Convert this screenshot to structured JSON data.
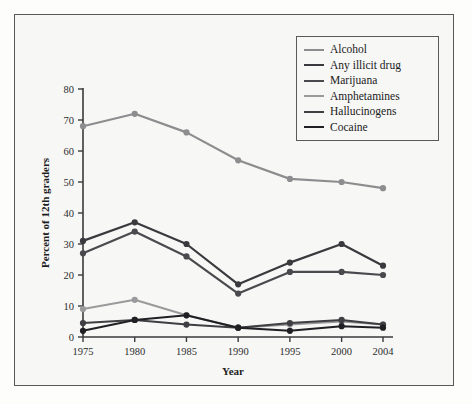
{
  "figure": {
    "background_color": "#f7f7f5",
    "frame_color": "#58585a"
  },
  "chart_data": {
    "type": "line",
    "title": "",
    "xlabel": "Year",
    "ylabel": "Percent of 12th graders",
    "x": [
      1975,
      1980,
      1985,
      1990,
      1995,
      2000,
      2004
    ],
    "categories": [
      "1975",
      "1980",
      "1985",
      "1990",
      "1995",
      "2000",
      "2004"
    ],
    "xtick_labels": [
      "1975",
      "1980",
      "1985",
      "1990",
      "1995",
      "2000",
      "2004"
    ],
    "ytick_labels": [
      "0",
      "10",
      "20",
      "30",
      "40",
      "50",
      "60",
      "70",
      "80"
    ],
    "yticks": [
      0,
      10,
      20,
      30,
      40,
      50,
      60,
      70,
      80
    ],
    "ylim": [
      0,
      80
    ],
    "xlim": [
      1975,
      2004
    ],
    "grid": false,
    "legend_position": "top-right",
    "series": [
      {
        "name": "Alcohol",
        "color": "#8d8d8f",
        "width": 2.2,
        "values": [
          68,
          72,
          66,
          57,
          51,
          50,
          48
        ]
      },
      {
        "name": "Any illicit drug",
        "color": "#3a3a3e",
        "width": 2.2,
        "values": [
          31,
          37,
          30,
          17,
          24,
          30,
          23
        ]
      },
      {
        "name": "Marijuana",
        "color": "#4a4a4e",
        "width": 2.2,
        "values": [
          27,
          34,
          26,
          14,
          21,
          21,
          20
        ]
      },
      {
        "name": "Amphetamines",
        "color": "#9a9a9c",
        "width": 2.0,
        "values": [
          9,
          12,
          7,
          3,
          4,
          5,
          4
        ]
      },
      {
        "name": "Hallucinogens",
        "color": "#3f3f43",
        "width": 2.0,
        "values": [
          4.5,
          5.5,
          4,
          3,
          4.5,
          5.5,
          4
        ]
      },
      {
        "name": "Cocaine",
        "color": "#202024",
        "width": 2.0,
        "values": [
          2,
          5.5,
          7,
          3,
          2,
          3.5,
          3
        ]
      }
    ]
  }
}
